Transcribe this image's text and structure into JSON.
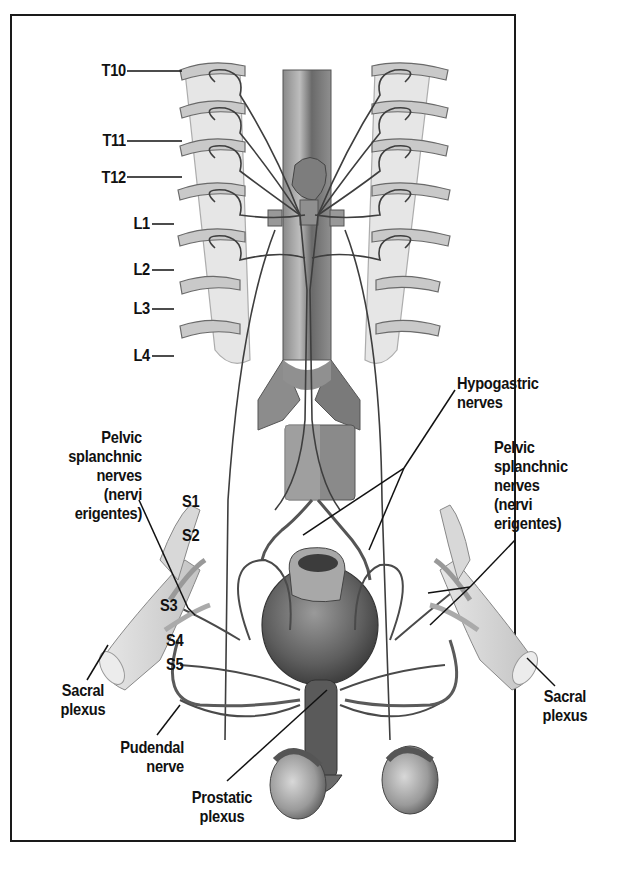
{
  "figure": {
    "colors": {
      "frame": "#1a1a1a",
      "label": "#111111",
      "nerve": "#4a4a4a",
      "bone": "#cfcfcf",
      "organ": "#6e6e6e"
    }
  },
  "labels": {
    "spinal_levels": [
      "T10",
      "T11",
      "T12",
      "L1",
      "L2",
      "L3",
      "L4"
    ],
    "sacral_levels": [
      "S1",
      "S2",
      "S3",
      "S4",
      "S5"
    ],
    "pelvic_splanchnic_left": [
      "Pelvic",
      "splanchnic",
      "nerves",
      "(nervi",
      "erigentes)"
    ],
    "pelvic_splanchnic_right": [
      "Pelvic",
      "splanchnic",
      "nerves",
      "(nervi",
      "erigentes)"
    ],
    "hypogastric": [
      "Hypogastric",
      "nerves"
    ],
    "sacral_plexus_left": [
      "Sacral",
      "plexus"
    ],
    "sacral_plexus_right": [
      "Sacral",
      "plexus"
    ],
    "pudendal": [
      "Pudendal",
      "nerve"
    ],
    "prostatic": [
      "Prostatic",
      "plexus"
    ]
  }
}
